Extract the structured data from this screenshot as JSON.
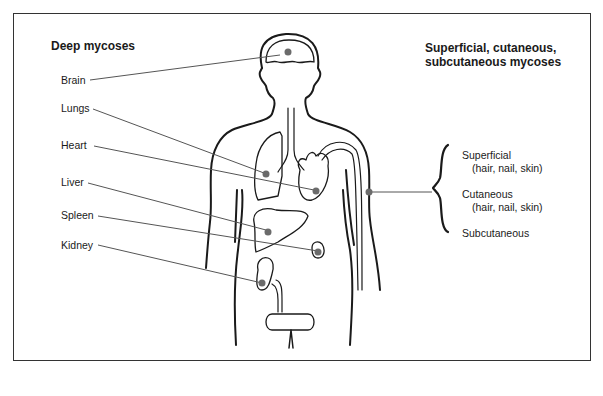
{
  "diagram": {
    "left_heading": "Deep mycoses",
    "right_heading_line1": "Superficial, cutaneous,",
    "right_heading_line2": "subcutaneous mycoses",
    "deep_sites": [
      {
        "label": "Brain"
      },
      {
        "label": "Lungs"
      },
      {
        "label": "Heart"
      },
      {
        "label": "Liver"
      },
      {
        "label": "Spleen"
      },
      {
        "label": "Kidney"
      }
    ],
    "surface_sites": [
      {
        "label": "Superficial",
        "detail": "(hair, nail, skin)"
      },
      {
        "label": "Cutaneous",
        "detail": "(hair, nail, skin)"
      },
      {
        "label": "Subcutaneous",
        "detail": ""
      }
    ],
    "colors": {
      "outline": "#1a1a1a",
      "marker": "#6b6b6b",
      "leader": "#555555"
    }
  }
}
